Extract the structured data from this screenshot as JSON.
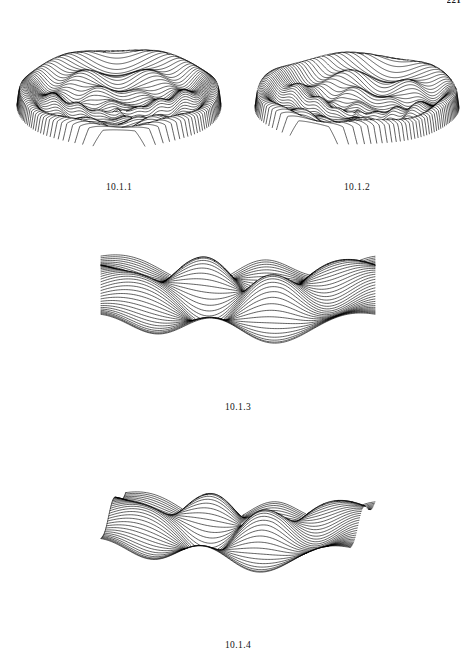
{
  "page": {
    "number": "221",
    "background_color": "#ffffff",
    "ink_color": "#000000",
    "width": 473,
    "height": 664
  },
  "figures": [
    {
      "id": "fig-10-1-1",
      "caption": "10.1.1",
      "kind": "wireframe-surface-3d",
      "description": "hidden-line removed mesh surface, radially symmetric crater with oscillating rings",
      "box": {
        "x": 14,
        "y": 18,
        "w": 210,
        "h": 160
      }
    },
    {
      "id": "fig-10-1-2",
      "caption": "10.1.2",
      "kind": "wireframe-surface-3d",
      "description": "hidden-line removed mesh surface, radially symmetric crater, alternate viewing azimuth",
      "box": {
        "x": 252,
        "y": 18,
        "w": 210,
        "h": 160
      }
    },
    {
      "id": "fig-10-1-3",
      "caption": "10.1.3",
      "kind": "wireframe-surface-3d",
      "description": "hidden-line removed mesh surface, diagonal saddle with ripple peaks",
      "box": {
        "x": 98,
        "y": 200,
        "w": 280,
        "h": 198
      }
    },
    {
      "id": "fig-10-1-4",
      "caption": "10.1.4",
      "kind": "wireframe-surface-3d",
      "description": "hidden-line removed mesh surface, diagonal saddle with ripple peaks, alternate elevation",
      "box": {
        "x": 98,
        "y": 432,
        "w": 280,
        "h": 200
      }
    }
  ],
  "chart_data": [
    {
      "type": "line",
      "id": "fig-10-1-1",
      "title": "10.1.1",
      "surface": "crater",
      "render": "profile-lines-hidden-line-removed",
      "grid": false,
      "legend": false,
      "xlabel": "",
      "ylabel": "",
      "nu": 62,
      "nv": 150,
      "domain_radius": 1.0,
      "azimuth_deg": 0,
      "elevation": 0.4,
      "z_scale": 0.78,
      "plot_w": 210,
      "plot_h": 160,
      "terms": [
        {
          "kind": "ring",
          "amp": 1.0,
          "r0": 0.93,
          "width": 0.16
        },
        {
          "kind": "ring",
          "amp": 0.62,
          "r0": 0.64,
          "width": 0.13
        },
        {
          "kind": "ring",
          "amp": 0.4,
          "r0": 0.4,
          "width": 0.11
        },
        {
          "kind": "ring",
          "amp": 0.26,
          "r0": 0.19,
          "width": 0.1
        },
        {
          "kind": "bump",
          "amp": 0.3,
          "x0": 0.0,
          "y0": 0.0,
          "width": 0.1
        },
        {
          "kind": "angular",
          "amp": 0.16,
          "k": 6,
          "phase": 0.3,
          "r0": 0.62,
          "width": 0.3
        },
        {
          "kind": "angular",
          "amp": 0.1,
          "k": 4,
          "phase": 1.1,
          "r0": 0.33,
          "width": 0.26
        }
      ]
    },
    {
      "type": "line",
      "id": "fig-10-1-2",
      "title": "10.1.2",
      "surface": "crater",
      "render": "profile-lines-hidden-line-removed",
      "grid": false,
      "legend": false,
      "xlabel": "",
      "ylabel": "",
      "nu": 60,
      "nv": 150,
      "domain_radius": 1.0,
      "azimuth_deg": 26,
      "elevation": 0.36,
      "z_scale": 0.8,
      "plot_w": 210,
      "plot_h": 160,
      "terms": [
        {
          "kind": "ring",
          "amp": 1.0,
          "r0": 0.93,
          "width": 0.16
        },
        {
          "kind": "ring",
          "amp": 0.62,
          "r0": 0.64,
          "width": 0.13
        },
        {
          "kind": "ring",
          "amp": 0.4,
          "r0": 0.4,
          "width": 0.11
        },
        {
          "kind": "ring",
          "amp": 0.26,
          "r0": 0.19,
          "width": 0.1
        },
        {
          "kind": "bump",
          "amp": 0.3,
          "x0": 0.0,
          "y0": 0.0,
          "width": 0.1
        },
        {
          "kind": "angular",
          "amp": 0.16,
          "k": 6,
          "phase": 0.3,
          "r0": 0.62,
          "width": 0.3
        },
        {
          "kind": "angular",
          "amp": 0.1,
          "k": 4,
          "phase": 1.1,
          "r0": 0.33,
          "width": 0.26
        }
      ]
    },
    {
      "type": "line",
      "id": "fig-10-1-3",
      "title": "10.1.3",
      "surface": "saddle-ripple",
      "render": "profile-lines-hidden-line-removed",
      "grid": false,
      "legend": false,
      "xlabel": "",
      "ylabel": "",
      "nu": 46,
      "nv": 170,
      "azimuth_deg": 0,
      "elevation": 0.3,
      "z_scale": 1.0,
      "plot_w": 280,
      "plot_h": 198,
      "wave": {
        "kx": 3.05,
        "ky": 3.05,
        "saddle": 0.95,
        "ripple": 0.52,
        "decay": 0.22
      }
    },
    {
      "type": "line",
      "id": "fig-10-1-4",
      "title": "10.1.4",
      "surface": "saddle-ripple",
      "render": "profile-lines-hidden-line-removed",
      "grid": false,
      "legend": false,
      "xlabel": "",
      "ylabel": "",
      "nu": 46,
      "nv": 170,
      "azimuth_deg": 8,
      "elevation": 0.26,
      "z_scale": 1.05,
      "plot_w": 280,
      "plot_h": 200,
      "wave": {
        "kx": 3.05,
        "ky": 3.05,
        "saddle": 0.95,
        "ripple": 0.52,
        "decay": 0.22
      }
    }
  ]
}
